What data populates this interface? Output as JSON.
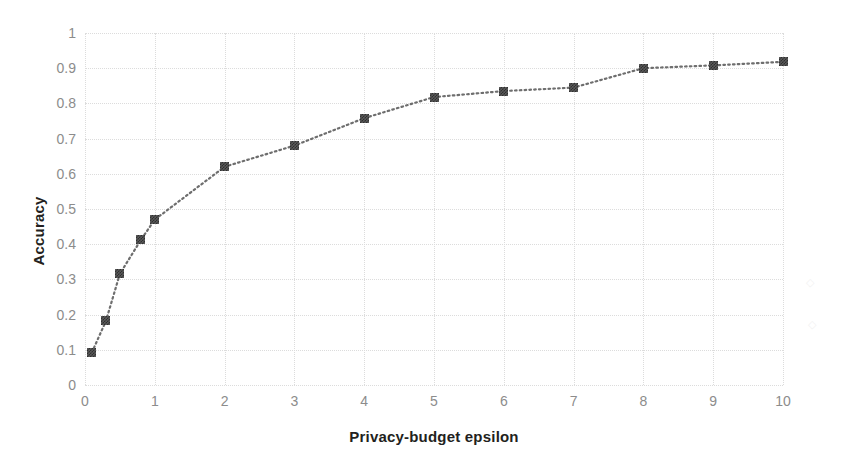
{
  "chart_data": {
    "type": "line",
    "title": "",
    "xlabel": "Privacy-budget epsilon",
    "ylabel": "Accuracy",
    "xlim": [
      0,
      10
    ],
    "ylim": [
      0,
      1
    ],
    "grid": true,
    "legend": false,
    "marker": "dithered-square",
    "line_style": "dotted",
    "line_color": "#6e6e6e",
    "marker_color": "#3a3a3a",
    "xticks": [
      "0",
      "1",
      "2",
      "3",
      "4",
      "5",
      "6",
      "7",
      "8",
      "9",
      "10"
    ],
    "yticks": [
      "0",
      "0.1",
      "0.2",
      "0.3",
      "0.4",
      "0.5",
      "0.6",
      "0.7",
      "0.8",
      "0.9",
      "1"
    ],
    "x": [
      0.1,
      0.3,
      0.5,
      0.8,
      1.0,
      2.0,
      3.0,
      4.0,
      5.0,
      6.0,
      7.0,
      8.0,
      9.0,
      10.0
    ],
    "values": [
      0.093,
      0.182,
      0.316,
      0.412,
      0.47,
      0.62,
      0.68,
      0.758,
      0.818,
      0.835,
      0.845,
      0.9,
      0.908,
      0.918
    ],
    "series": [
      {
        "name": "Accuracy",
        "x": [
          0.1,
          0.3,
          0.5,
          0.8,
          1.0,
          2.0,
          3.0,
          4.0,
          5.0,
          6.0,
          7.0,
          8.0,
          9.0,
          10.0
        ],
        "values": [
          0.093,
          0.182,
          0.316,
          0.412,
          0.47,
          0.62,
          0.68,
          0.758,
          0.818,
          0.835,
          0.845,
          0.9,
          0.908,
          0.918
        ]
      }
    ],
    "annotations": []
  },
  "axes": {
    "y_title": "Accuracy",
    "x_title": "Privacy-budget epsilon"
  },
  "colors": {
    "background": "#ffffff",
    "gridline": "#dcdcdc",
    "tick_label": "#8c8c8c",
    "axis_title": "#231f20",
    "series": "#3a3a3a"
  }
}
